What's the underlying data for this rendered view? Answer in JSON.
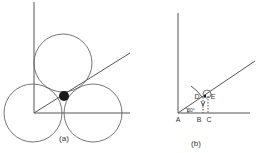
{
  "panels": [
    {
      "caption": "(a)",
      "description": "Three mutually tangent circles inside a right angle with a 30-degree bisecting line and a small filled circle at the center"
    },
    {
      "caption": "(b)",
      "labels": {
        "A": "A",
        "B": "B",
        "C": "C",
        "D": "D",
        "E": "E",
        "angle": "30°"
      }
    }
  ],
  "colors": {
    "line": "#555555",
    "fill": "#1a1a1a",
    "background": "#ffffff"
  }
}
